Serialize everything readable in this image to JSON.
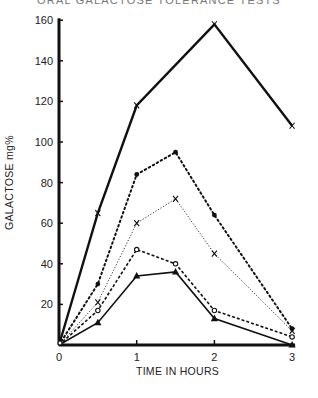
{
  "chart": {
    "title": "ORAL GALACTOSE TOLERANCE TESTS",
    "xlabel": "TIME IN HOURS",
    "ylabel": "GALACTOSE mg%"
  },
  "chart_data": {
    "type": "line",
    "title": "ORAL GALACTOSE TOLERANCE TESTS",
    "xlabel": "TIME IN HOURS",
    "ylabel": "GALACTOSE mg%",
    "xlim": [
      0,
      3
    ],
    "ylim": [
      0,
      160
    ],
    "x_ticks": [
      0,
      1,
      2,
      3
    ],
    "y_ticks": [
      20,
      40,
      60,
      80,
      100,
      120,
      140,
      160
    ],
    "grid": false,
    "legend": "none",
    "series": [
      {
        "name": "curve-1 (solid heavy, x markers)",
        "style": "solid-heavy",
        "marker": "x",
        "x": [
          0,
          0.5,
          1,
          2,
          3
        ],
        "values": [
          0,
          65,
          118,
          158,
          108
        ]
      },
      {
        "name": "curve-2 (dotted, filled circles)",
        "style": "dotted",
        "marker": "filled-circle",
        "x": [
          0,
          0.5,
          1,
          1.5,
          2,
          3
        ],
        "values": [
          0,
          30,
          84,
          95,
          64,
          8
        ]
      },
      {
        "name": "curve-3 (thin dotted, x markers)",
        "style": "thin-dotted",
        "marker": "x",
        "x": [
          0,
          0.5,
          1,
          1.5,
          2,
          3
        ],
        "values": [
          0,
          21,
          60,
          72,
          45,
          7
        ]
      },
      {
        "name": "curve-4 (dashed, open circles)",
        "style": "dashed",
        "marker": "open-circle",
        "x": [
          0,
          0.5,
          1,
          1.5,
          2,
          3
        ],
        "values": [
          0,
          17,
          47,
          40,
          17,
          4
        ]
      },
      {
        "name": "curve-5 (solid, filled triangles)",
        "style": "solid",
        "marker": "filled-triangle",
        "x": [
          0,
          0.5,
          1,
          1.5,
          2,
          3
        ],
        "values": [
          0,
          11,
          34,
          36,
          13,
          0
        ]
      }
    ]
  }
}
